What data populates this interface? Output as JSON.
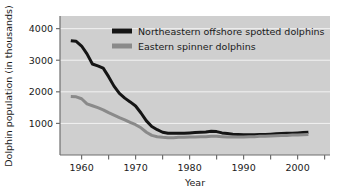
{
  "chart_data": {
    "type": "line",
    "title": "",
    "xlabel": "Year",
    "ylabel": "Dolphin population (in thousands)",
    "xlim": [
      1956,
      2006
    ],
    "ylim": [
      0,
      4400
    ],
    "xticks": [
      1960,
      1970,
      1980,
      1990,
      2000
    ],
    "xtick_labels": [
      "1960",
      "1970",
      "1980",
      "1990",
      "2000"
    ],
    "xminorticks": [
      1965,
      1975,
      1985,
      1995,
      2005
    ],
    "yticks": [
      1000,
      2000,
      3000,
      4000
    ],
    "ytick_labels": [
      "1000",
      "2000",
      "3000",
      "4000"
    ],
    "grid": "horizontal-white-gridlines",
    "legend_position": "top-center-inside",
    "plot_background": "#cfcfcf",
    "series": [
      {
        "name": "Northeastern offshore spotted dolphins",
        "color": "#151515",
        "x": [
          1958,
          1959,
          1960,
          1961,
          1962,
          1963,
          1964,
          1965,
          1966,
          1967,
          1968,
          1969,
          1970,
          1971,
          1972,
          1973,
          1974,
          1975,
          1976,
          1977,
          1978,
          1979,
          1980,
          1981,
          1982,
          1983,
          1984,
          1985,
          1986,
          1987,
          1988,
          1989,
          1990,
          1991,
          1992,
          1993,
          1994,
          1995,
          1996,
          1997,
          1998,
          1999,
          2000,
          2001,
          2002
        ],
        "values": [
          3620,
          3600,
          3450,
          3200,
          2880,
          2820,
          2750,
          2480,
          2180,
          1950,
          1800,
          1680,
          1550,
          1330,
          1080,
          900,
          800,
          720,
          690,
          690,
          690,
          690,
          700,
          710,
          720,
          730,
          750,
          740,
          700,
          680,
          660,
          650,
          640,
          640,
          640,
          650,
          650,
          660,
          670,
          680,
          690,
          690,
          700,
          710,
          720
        ]
      },
      {
        "name": "Eastern spinner dolphins",
        "color": "#8a8a8a",
        "x": [
          1958,
          1959,
          1960,
          1961,
          1962,
          1963,
          1964,
          1965,
          1966,
          1967,
          1968,
          1969,
          1970,
          1971,
          1972,
          1973,
          1974,
          1975,
          1976,
          1977,
          1978,
          1979,
          1980,
          1981,
          1982,
          1983,
          1984,
          1985,
          1986,
          1987,
          1988,
          1989,
          1990,
          1991,
          1992,
          1993,
          1994,
          1995,
          1996,
          1997,
          1998,
          1999,
          2000,
          2001,
          2002
        ],
        "values": [
          1850,
          1840,
          1780,
          1620,
          1560,
          1500,
          1430,
          1340,
          1260,
          1180,
          1110,
          1030,
          960,
          860,
          720,
          620,
          580,
          560,
          550,
          550,
          560,
          560,
          570,
          570,
          580,
          580,
          590,
          590,
          580,
          570,
          570,
          570,
          570,
          580,
          580,
          590,
          590,
          600,
          610,
          620,
          620,
          630,
          630,
          640,
          650
        ]
      }
    ]
  },
  "legend": {
    "entries": [
      {
        "label": "Northeastern offshore spotted dolphins",
        "color": "#151515"
      },
      {
        "label": "Eastern spinner dolphins",
        "color": "#8a8a8a"
      }
    ]
  }
}
